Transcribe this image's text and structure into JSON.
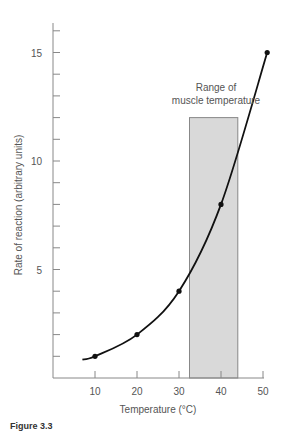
{
  "chart_data": {
    "type": "line",
    "title": "",
    "xlabel": "Temperature (°C)",
    "ylabel": "Rate of reaction (arbitrary units)",
    "xlim": [
      0,
      52
    ],
    "ylim": [
      0,
      16
    ],
    "x_ticks": [
      10,
      20,
      30,
      40,
      50
    ],
    "y_ticks_labeled": [
      5,
      10,
      15
    ],
    "y_minor_ticks": [
      1,
      2,
      3,
      4,
      6,
      7,
      8,
      9,
      11,
      12,
      13,
      14,
      16
    ],
    "grid": false,
    "series": [
      {
        "name": "Rate of reaction",
        "points": [
          {
            "x": 10,
            "y": 1
          },
          {
            "x": 20,
            "y": 2
          },
          {
            "x": 30,
            "y": 4
          },
          {
            "x": 40,
            "y": 8
          },
          {
            "x": 51,
            "y": 15
          }
        ],
        "curve_start": {
          "x": 7,
          "y": 0.85
        },
        "color": "#111111"
      }
    ],
    "shaded_region": {
      "label_line1": "Range of",
      "label_line2": "muscle temperature",
      "x_start": 32.5,
      "x_end": 44,
      "y_top": 12,
      "fill": "#d9d9d9",
      "stroke": "#888888"
    },
    "axis_color": "#888888"
  },
  "caption": {
    "text": "Figure 3.3"
  }
}
